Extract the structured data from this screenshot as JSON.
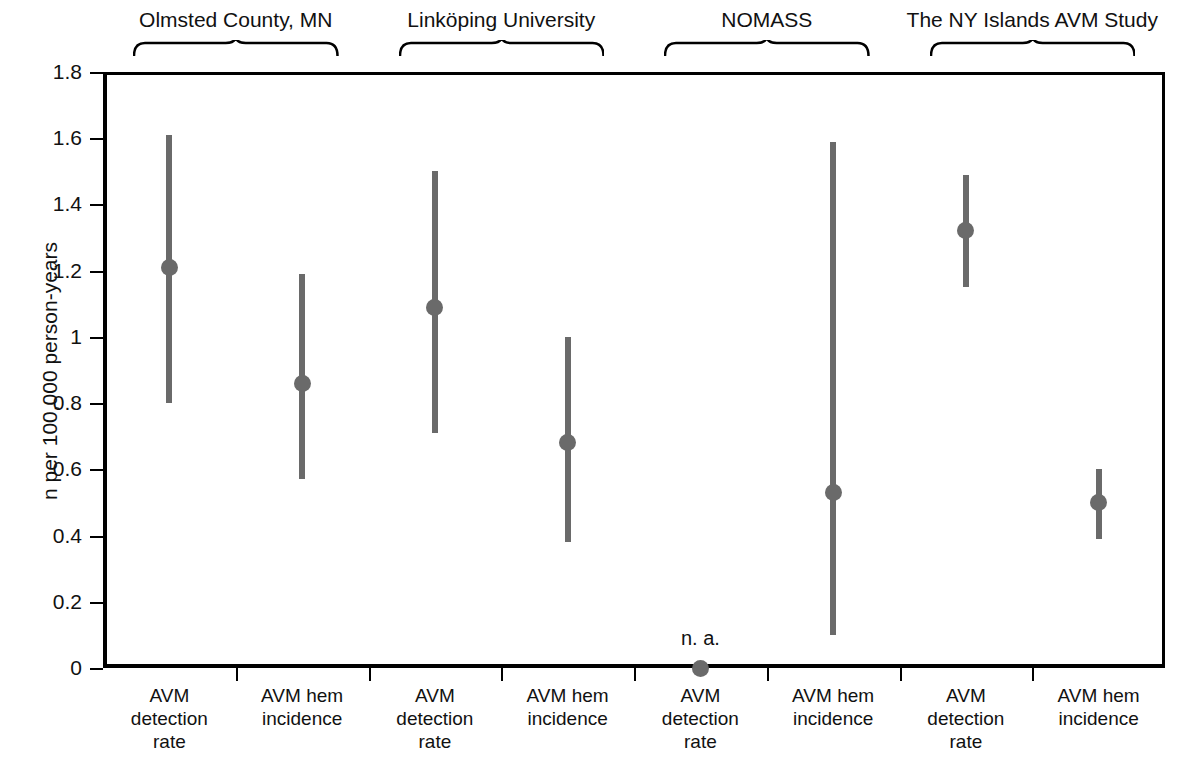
{
  "chart_data": {
    "type": "scatter",
    "title": "",
    "xlabel": "",
    "ylabel": "n per 100,000 person-years",
    "ylim": [
      0,
      1.8
    ],
    "yticks": [
      "0",
      "0.2",
      "0.4",
      "0.6",
      "0.8",
      "1",
      "1.2",
      "1.4",
      "1.6",
      "1.8"
    ],
    "ytick_values": [
      0,
      0.2,
      0.4,
      0.6,
      0.8,
      1.0,
      1.2,
      1.4,
      1.6,
      1.8
    ],
    "grid": false,
    "legend": "none",
    "annotations": [
      "n. a."
    ],
    "groups": [
      {
        "label": "Olmsted County, MN"
      },
      {
        "label": "Linköping University"
      },
      {
        "label": "NOMASS"
      },
      {
        "label": "The NY Islands AVM Study"
      }
    ],
    "categories": [
      "AVM detection rate",
      "AVM hem incidence",
      "AVM detection rate",
      "AVM hem incidence",
      "AVM detection rate",
      "AVM hem incidence",
      "AVM detection rate",
      "AVM hem incidence"
    ],
    "category_lines": [
      [
        "AVM",
        "detection",
        "rate"
      ],
      [
        "AVM hem",
        "incidence"
      ],
      [
        "AVM",
        "detection",
        "rate"
      ],
      [
        "AVM hem",
        "incidence"
      ],
      [
        "AVM",
        "detection",
        "rate"
      ],
      [
        "AVM hem",
        "incidence"
      ],
      [
        "AVM",
        "detection",
        "rate"
      ],
      [
        "AVM hem",
        "incidence"
      ]
    ],
    "points": [
      {
        "group": "Olmsted County, MN",
        "category": "AVM detection rate",
        "value": 1.21,
        "ci_low": 0.8,
        "ci_high": 1.61,
        "note": ""
      },
      {
        "group": "Olmsted County, MN",
        "category": "AVM hem incidence",
        "value": 0.86,
        "ci_low": 0.57,
        "ci_high": 1.19,
        "note": ""
      },
      {
        "group": "Linköping University",
        "category": "AVM detection rate",
        "value": 1.09,
        "ci_low": 0.71,
        "ci_high": 1.5,
        "note": ""
      },
      {
        "group": "Linköping University",
        "category": "AVM hem incidence",
        "value": 0.68,
        "ci_low": 0.38,
        "ci_high": 1.0,
        "note": ""
      },
      {
        "group": "NOMASS",
        "category": "AVM detection rate",
        "value": 0.0,
        "ci_low": 0.0,
        "ci_high": 0.0,
        "note": "n. a."
      },
      {
        "group": "NOMASS",
        "category": "AVM hem incidence",
        "value": 0.53,
        "ci_low": 0.1,
        "ci_high": 1.59,
        "note": ""
      },
      {
        "group": "The NY Islands AVM Study",
        "category": "AVM detection rate",
        "value": 1.32,
        "ci_low": 1.15,
        "ci_high": 1.49,
        "note": ""
      },
      {
        "group": "The NY Islands AVM Study",
        "category": "AVM hem incidence",
        "value": 0.5,
        "ci_low": 0.39,
        "ci_high": 0.6,
        "note": ""
      }
    ],
    "colors": {
      "marker": "#6a6a6a",
      "axis": "#000000",
      "text": "#111111",
      "background": "#ffffff"
    }
  }
}
